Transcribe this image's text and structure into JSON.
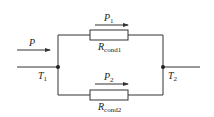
{
  "diagram": {
    "input_label": "P",
    "node_left_label": "T",
    "node_left_sub": "1",
    "node_right_label": "T",
    "node_right_sub": "2",
    "branch_top": {
      "flow_label": "P",
      "flow_sub": "1",
      "resistor_label": "R",
      "resistor_sub": "cond1"
    },
    "branch_bottom": {
      "flow_label": "P",
      "flow_sub": "2",
      "resistor_label": "R",
      "resistor_sub": "cond2"
    },
    "line_color": "#333333"
  }
}
